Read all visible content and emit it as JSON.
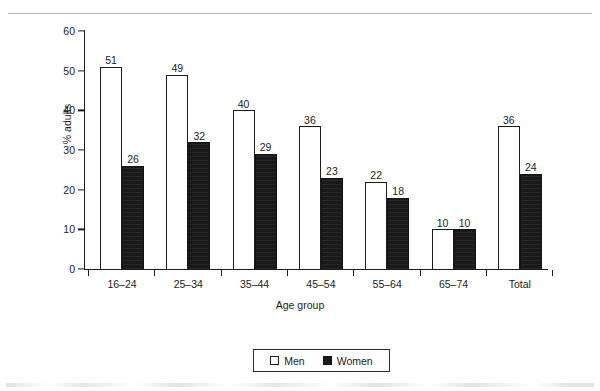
{
  "chart_data": {
    "type": "bar",
    "title": "",
    "xlabel": "Age group",
    "ylabel": "% adults",
    "ylim": [
      0,
      60
    ],
    "yticks": [
      0,
      10,
      20,
      30,
      40,
      50,
      60
    ],
    "grid": false,
    "legend_position": "bottom-center",
    "categories": [
      "16–24",
      "25–34",
      "35–44",
      "45–54",
      "55–64",
      "65–74",
      "Total"
    ],
    "series": [
      {
        "name": "Men",
        "color": "#ffffff",
        "values": [
          51,
          49,
          40,
          36,
          22,
          10,
          36
        ]
      },
      {
        "name": "Women",
        "color": "#191919",
        "values": [
          26,
          32,
          29,
          23,
          18,
          10,
          24
        ]
      }
    ]
  },
  "legend": {
    "items": [
      {
        "label": "Men",
        "swatch": "open-square-swatch"
      },
      {
        "label": "Women",
        "swatch": "filled-square-swatch"
      }
    ]
  },
  "axes": {
    "y_tick_labels": [
      "0",
      "10",
      "20",
      "30",
      "40",
      "50",
      "60"
    ],
    "x_tick_labels": [
      "16–24",
      "25–34",
      "35–44",
      "45–54",
      "55–64",
      "65–74",
      "Total"
    ],
    "y_axis_title": "% adults",
    "x_axis_title": "Age group"
  },
  "value_labels": {
    "men": [
      "51",
      "49",
      "40",
      "36",
      "22",
      "10",
      "36"
    ],
    "women": [
      "26",
      "32",
      "29",
      "23",
      "18",
      "10",
      "24"
    ]
  }
}
